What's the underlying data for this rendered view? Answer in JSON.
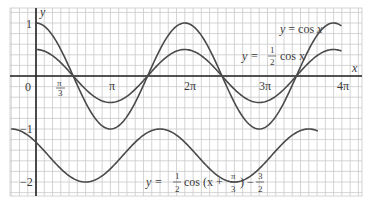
{
  "chart_data": {
    "type": "line",
    "title": "",
    "xlabel": "x",
    "ylabel": "y",
    "xlim_multiples_of_pi": [
      -0.333,
      4.08
    ],
    "ylim": [
      -2.25,
      1.3
    ],
    "grid": true,
    "x_ticks": [
      {
        "label": "0",
        "value": 0
      },
      {
        "label": "π/3",
        "value": 1.0472
      },
      {
        "label": "π",
        "value": 3.1416
      },
      {
        "label": "2π",
        "value": 6.2832
      },
      {
        "label": "3π",
        "value": 9.4248
      },
      {
        "label": "4π",
        "value": 12.5664
      }
    ],
    "y_ticks": [
      {
        "label": "1",
        "value": 1
      },
      {
        "label": "−1",
        "value": -1
      },
      {
        "label": "−2",
        "value": -2
      }
    ],
    "series": [
      {
        "name": "y = cos x",
        "expr": "cos(x)",
        "amplitude": 1,
        "phase": 0,
        "shift": 0,
        "x_from": 0,
        "x_to": 12.9
      },
      {
        "name": "y = ½ cos x",
        "expr": "0.5*cos(x)",
        "amplitude": 0.5,
        "phase": 0,
        "shift": 0,
        "x_from": 0,
        "x_to": 12.9
      },
      {
        "name": "y = ½ cos(x + π/3) − 3/2",
        "expr": "0.5*cos(x+pi/3)-1.5",
        "amplitude": 0.5,
        "phase": 1.0472,
        "shift": -1.5,
        "x_from": -1.05,
        "x_to": 11.9
      }
    ],
    "annotations": [
      {
        "text": "y = cos x",
        "near_x_pi": 3.5,
        "near_y": 0.85
      },
      {
        "text": "y = ½ cos x",
        "near_x_pi": 2.6,
        "near_y": 0.35
      },
      {
        "text": "y = ½ cos (x + π/3) − 3/2",
        "near_x_pi": 1.4,
        "near_y": -2.0
      }
    ]
  },
  "labels": {
    "y_axis": "y",
    "x_axis": "x",
    "origin": "0",
    "tick_pi_over_3_num": "π",
    "tick_pi_over_3_den": "3",
    "tick_pi": "π",
    "tick_2pi": "2π",
    "tick_3pi": "3π",
    "tick_4pi": "4π",
    "y_1": "1",
    "y_neg1": "−1",
    "y_neg2": "−2",
    "curve1": "y = cos x",
    "curve2_prefix": "y =",
    "curve2_num": "1",
    "curve2_den": "2",
    "curve2_suffix": "cos x",
    "curve3_prefix": "y =",
    "curve3_num": "1",
    "curve3_den": "2",
    "curve3_mid": "cos (x +",
    "curve3_pi_num": "π",
    "curve3_pi_den": "3",
    "curve3_close": ") −",
    "curve3_c_num": "3",
    "curve3_c_den": "2"
  }
}
